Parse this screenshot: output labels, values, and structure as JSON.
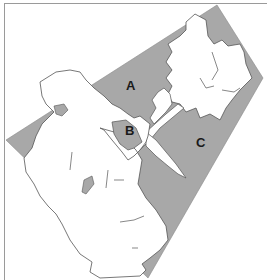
{
  "diagram": {
    "colors": {
      "background": "#ffffff",
      "shaded_region": "#a8a8a8",
      "silhouette": "#ffffff",
      "outline": "#555555",
      "label": "#1a1a1a"
    },
    "labels": {
      "a": "A",
      "b": "B",
      "c": "C"
    }
  }
}
